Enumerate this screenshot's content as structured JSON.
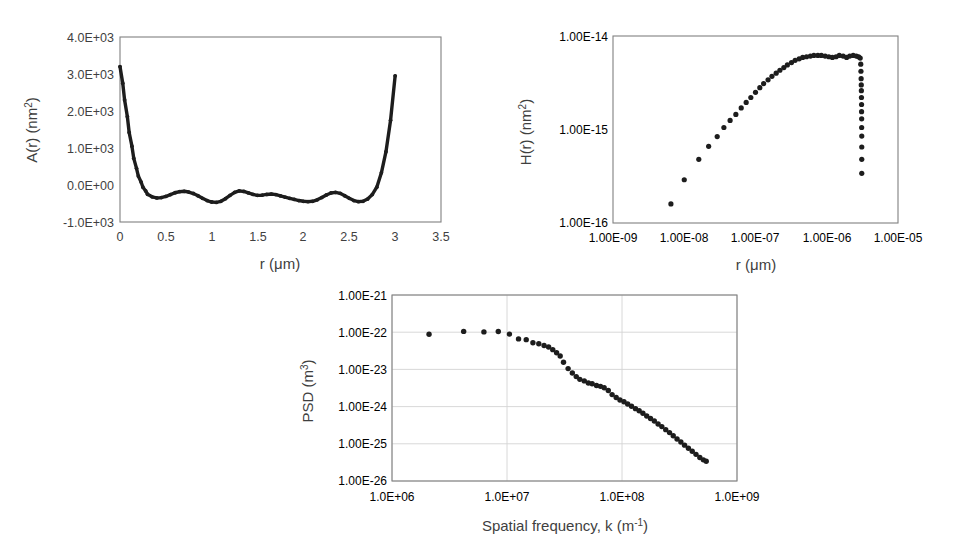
{
  "figure": {
    "background": "#ffffff",
    "marker_color": "#1d1d1d",
    "frame_color": "#808080",
    "grid_color": "#d4d4d4"
  },
  "panels": {
    "panel_a": {
      "name": "autocovariance-plot",
      "chart_data": {
        "type": "scatter",
        "title": "",
        "xlabel": "r (μm)",
        "ylabel": "A(r) (nm²)",
        "ylabel_base": "A(r) (nm",
        "ylabel_sup": "2",
        "ylabel_tail": ")",
        "xscale": "linear",
        "yscale": "linear",
        "xlim": [
          0,
          3.5
        ],
        "ylim": [
          -1000,
          4000
        ],
        "grid": false,
        "xticks": [
          0,
          0.5,
          1,
          1.5,
          2,
          2.5,
          3,
          3.5
        ],
        "xticklabels": [
          "0",
          "0.5",
          "1",
          "1.5",
          "2",
          "2.5",
          "3",
          "3.5"
        ],
        "yticks": [
          4000,
          3000,
          2000,
          1000,
          0,
          -1000
        ],
        "yticklabels": [
          "4.0E+03",
          "3.0E+03",
          "2.0E+03",
          "1.0E+03",
          "0.0E+00",
          "-1.0E+03"
        ],
        "x": [
          0.0,
          0.03,
          0.05,
          0.08,
          0.1,
          0.13,
          0.15,
          0.18,
          0.2,
          0.23,
          0.25,
          0.28,
          0.3,
          0.35,
          0.4,
          0.45,
          0.5,
          0.55,
          0.6,
          0.65,
          0.7,
          0.75,
          0.8,
          0.85,
          0.9,
          0.95,
          1.0,
          1.05,
          1.1,
          1.15,
          1.2,
          1.25,
          1.3,
          1.35,
          1.4,
          1.45,
          1.5,
          1.55,
          1.6,
          1.65,
          1.7,
          1.75,
          1.8,
          1.85,
          1.9,
          1.95,
          2.0,
          2.05,
          2.1,
          2.15,
          2.2,
          2.25,
          2.3,
          2.35,
          2.4,
          2.45,
          2.5,
          2.55,
          2.6,
          2.65,
          2.7,
          2.75,
          2.8,
          2.85,
          2.9,
          2.95,
          3.0
        ],
        "y": [
          3200,
          2750,
          2300,
          1850,
          1420,
          1050,
          720,
          450,
          240,
          80,
          -60,
          -160,
          -250,
          -320,
          -350,
          -340,
          -310,
          -260,
          -210,
          -180,
          -170,
          -190,
          -230,
          -290,
          -360,
          -420,
          -460,
          -470,
          -440,
          -370,
          -280,
          -200,
          -160,
          -175,
          -215,
          -255,
          -280,
          -275,
          -255,
          -245,
          -260,
          -295,
          -330,
          -360,
          -390,
          -420,
          -440,
          -450,
          -440,
          -400,
          -340,
          -270,
          -215,
          -200,
          -225,
          -290,
          -360,
          -420,
          -450,
          -440,
          -380,
          -260,
          -60,
          330,
          900,
          1750,
          2950
        ]
      }
    },
    "panel_b": {
      "name": "height-correlation-plot",
      "chart_data": {
        "type": "scatter",
        "title": "",
        "xlabel": "r (μm)",
        "ylabel": "H(r) (nm²)",
        "ylabel_base": "H(r) (nm",
        "ylabel_sup": "2",
        "ylabel_tail": ")",
        "xscale": "log",
        "yscale": "log",
        "xlim": [
          1e-09,
          1e-05
        ],
        "ylim": [
          1e-16,
          1e-14
        ],
        "grid": false,
        "xticks": [
          1e-09,
          1e-08,
          1e-07,
          1e-06,
          1e-05
        ],
        "xticklabels": [
          "1.00E-09",
          "1.00E-08",
          "1.00E-07",
          "1.00E-06",
          "1.00E-05"
        ],
        "yticks": [
          1e-14,
          1e-15,
          1e-16
        ],
        "yticklabels": [
          "1.00E-14",
          "1.00E-15",
          "1.00E-16"
        ],
        "x": [
          6.5e-09,
          1e-08,
          1.6e-08,
          2.2e-08,
          2.9e-08,
          3.6e-08,
          4.4e-08,
          5.3e-08,
          6.3e-08,
          7.4e-08,
          8.6e-08,
          1e-07,
          1.15e-07,
          1.3e-07,
          1.5e-07,
          1.7e-07,
          1.95e-07,
          2.2e-07,
          2.5e-07,
          2.8e-07,
          3.2e-07,
          3.6e-07,
          4.1e-07,
          4.6e-07,
          5.2e-07,
          5.9e-07,
          6.6e-07,
          7.5e-07,
          8.4e-07,
          9.5e-07,
          1.07e-06,
          1.2e-06,
          1.35e-06,
          1.5e-06,
          1.7e-06,
          1.9e-06,
          2.1e-06,
          2.35e-06,
          2.6e-06,
          2.8e-06,
          2.95e-06,
          3e-06,
          3.02e-06,
          3.04e-06,
          3.05e-06,
          3.06e-06,
          3.07e-06,
          3.08e-06,
          3.08e-06,
          3.09e-06,
          3.09e-06,
          3.1e-06,
          3.1e-06,
          3.1e-06,
          3.1e-06
        ],
        "y": [
          1.6e-16,
          2.9e-16,
          4.8e-16,
          6.6e-16,
          8.4e-16,
          1.05e-15,
          1.25e-15,
          1.45e-15,
          1.7e-15,
          1.95e-15,
          2.2e-15,
          2.5e-15,
          2.8e-15,
          3.1e-15,
          3.4e-15,
          3.7e-15,
          4e-15,
          4.3e-15,
          4.6e-15,
          4.9e-15,
          5.2e-15,
          5.5e-15,
          5.7e-15,
          5.9e-15,
          6e-15,
          6.1e-15,
          6.2e-15,
          6.2e-15,
          6.2e-15,
          6.1e-15,
          6e-15,
          5.9e-15,
          6e-15,
          6.2e-15,
          6.1e-15,
          5.9e-15,
          6.1e-15,
          6.2e-15,
          6.1e-15,
          6e-15,
          5.8e-15,
          5e-15,
          4.2e-15,
          3.5e-15,
          3e-15,
          2.6e-15,
          2.2e-15,
          1.85e-15,
          1.55e-15,
          1.3e-15,
          1.05e-15,
          8.5e-16,
          6.5e-16,
          4.8e-16,
          3.4e-16
        ]
      }
    },
    "panel_c": {
      "name": "psd-plot",
      "chart_data": {
        "type": "scatter",
        "title": "",
        "xlabel": "Spatial frequency, k (m⁻¹)",
        "xlabel_base": "Spatial frequency, k (m",
        "xlabel_sup": "-1",
        "xlabel_tail": ")",
        "ylabel": "PSD (m³)",
        "ylabel_base": "PSD (m",
        "ylabel_sup": "3",
        "ylabel_tail": ")",
        "xscale": "log",
        "yscale": "log",
        "xlim": [
          1000000.0,
          1000000000.0
        ],
        "ylim": [
          1e-26,
          1e-21
        ],
        "grid": true,
        "xticks": [
          1000000.0,
          10000000.0,
          100000000.0,
          1000000000.0
        ],
        "xticklabels": [
          "1.0E+06",
          "1.0E+07",
          "1.0E+08",
          "1.0E+09"
        ],
        "yticks": [
          1e-21,
          1e-22,
          1e-23,
          1e-24,
          1e-25,
          1e-26
        ],
        "yticklabels": [
          "1.00E-21",
          "1.00E-22",
          "1.00E-23",
          "1.00E-24",
          "1.00E-25",
          "1.00E-26"
        ],
        "x": [
          2100000.0,
          4200000.0,
          6300000.0,
          8400000.0,
          10500000.0,
          12600000.0,
          14700000.0,
          16800000.0,
          18900000.0,
          21000000.0,
          23000000.0,
          25000000.0,
          27000000.0,
          29000000.0,
          31000000.0,
          34000000.0,
          37000000.0,
          40000000.0,
          43000000.0,
          47000000.0,
          51000000.0,
          55000000.0,
          60000000.0,
          65000000.0,
          70000000.0,
          76000000.0,
          82000000.0,
          89000000.0,
          96000000.0,
          104000000.0,
          112000000.0,
          121000000.0,
          131000000.0,
          141000000.0,
          152000000.0,
          164000000.0,
          177000000.0,
          191000000.0,
          206000000.0,
          222000000.0,
          240000000.0,
          259000000.0,
          279000000.0,
          301000000.0,
          325000000.0,
          350000000.0,
          378000000.0,
          408000000.0,
          440000000.0,
          475000000.0,
          510000000.0,
          540000000.0
        ],
        "y": [
          8.8e-23,
          1.05e-22,
          1.02e-22,
          1.04e-22,
          8.9e-23,
          6.6e-23,
          6.3e-23,
          5.2e-23,
          4.9e-23,
          4.4e-23,
          4e-23,
          3.4e-23,
          2.8e-23,
          2.3e-23,
          1.55e-23,
          1.05e-23,
          8e-24,
          6.4e-24,
          5.4e-24,
          4.9e-24,
          4.3e-24,
          4.1e-24,
          3.7e-24,
          3.5e-24,
          3.2e-24,
          2.7e-24,
          2.1e-24,
          1.75e-24,
          1.5e-24,
          1.35e-24,
          1.18e-24,
          1.02e-24,
          8.8e-25,
          7.7e-25,
          6.6e-25,
          5.6e-25,
          4.8e-25,
          4.1e-25,
          3.4e-25,
          2.9e-25,
          2.4e-25,
          2e-25,
          1.65e-25,
          1.35e-25,
          1.12e-25,
          9.2e-26,
          7.6e-26,
          6.3e-26,
          5.2e-26,
          4.3e-26,
          3.7e-26,
          3.4e-26
        ]
      }
    }
  }
}
